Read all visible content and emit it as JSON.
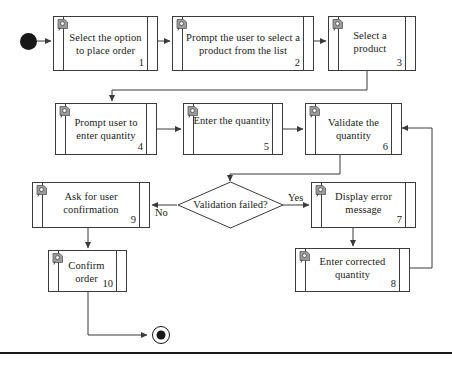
{
  "diagram": {
    "type": "uml-activity-flowchart",
    "title_text": "",
    "start_node": {
      "name": "initial-node"
    },
    "end_node": {
      "name": "final-node"
    },
    "nodes": [
      {
        "id": 1,
        "label": "Select the option to place order",
        "number": "1",
        "icon": "activity-icon"
      },
      {
        "id": 2,
        "label": "Prompt the user to select a product from the list",
        "number": "2",
        "icon": "activity-icon"
      },
      {
        "id": 3,
        "label": "Select a product",
        "number": "3",
        "icon": "activity-icon"
      },
      {
        "id": 4,
        "label": "Prompt user to enter quantity",
        "number": "4",
        "icon": "activity-icon"
      },
      {
        "id": 5,
        "label": "Enter the quantity",
        "number": "5",
        "icon": "activity-icon"
      },
      {
        "id": 6,
        "label": "Validate the quantity",
        "number": "6",
        "icon": "activity-icon"
      },
      {
        "id": 7,
        "label": "Display error message",
        "number": "7",
        "icon": "activity-icon"
      },
      {
        "id": 8,
        "label": "Enter corrected quantity",
        "number": "8",
        "icon": "activity-icon"
      },
      {
        "id": 9,
        "label": "Ask for user confirmation",
        "number": "9",
        "icon": "activity-icon"
      },
      {
        "id": 10,
        "label": "Confirm order",
        "number": "10",
        "icon": "activity-icon"
      }
    ],
    "decision": {
      "label": "Validation failed?"
    },
    "edge_labels": {
      "yes": "Yes",
      "no": "No"
    },
    "colors": {
      "stroke": "#3b3b3b",
      "text": "#1b1b1b",
      "node_fill": "#ffffff",
      "terminator": "#171717",
      "footer_rule": "#161616"
    }
  }
}
